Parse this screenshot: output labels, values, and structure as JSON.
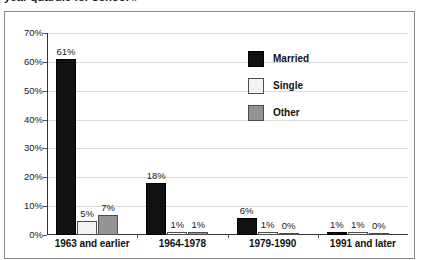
{
  "caption": {
    "text": "year quartile for school #"
  },
  "chart_data": {
    "type": "bar",
    "title": "",
    "xlabel": "",
    "ylabel": "",
    "ylim": [
      0,
      70
    ],
    "grid": true,
    "legend_position": "inside-top-right",
    "ytick_labels": [
      "70%",
      "60%",
      "50%",
      "40%",
      "30%",
      "20%",
      "10%",
      "0%"
    ],
    "ytick_values": [
      70,
      60,
      50,
      40,
      30,
      20,
      10,
      0
    ],
    "categories": [
      "1963 and earlier",
      "1964-1978",
      "1979-1990",
      "1991 and later"
    ],
    "series": [
      {
        "name": "Married",
        "color": "#111111",
        "values": [
          61,
          18,
          6,
          1
        ],
        "labels": [
          "61%",
          "18%",
          "6%",
          "1%"
        ]
      },
      {
        "name": "Single",
        "color": "#f2f2f2",
        "values": [
          5,
          1,
          1,
          1
        ],
        "labels": [
          "5%",
          "1%",
          "1%",
          "1%"
        ]
      },
      {
        "name": "Other",
        "color": "#949494",
        "values": [
          7,
          1,
          0,
          0
        ],
        "labels": [
          "7%",
          "1%",
          "0%",
          "0%"
        ]
      }
    ]
  }
}
